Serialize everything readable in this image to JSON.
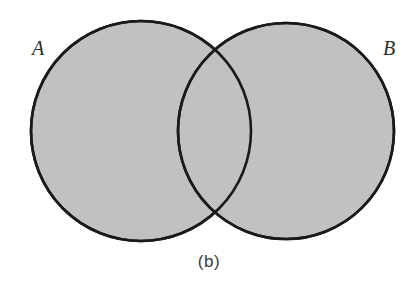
{
  "figure": {
    "caption": "(b)",
    "type": "venn-diagram",
    "background_color": "#ffffff",
    "stroke_color": "#1a1a1a",
    "fill_color": "#c3c3c3",
    "canvas": {
      "width": 418,
      "height": 283
    }
  },
  "sets": [
    {
      "id": "A",
      "label": "A",
      "fill": "#c3c3c3",
      "stroke": "#1a1a1a",
      "shape": "circle",
      "cx": 141,
      "cy": 131,
      "r": 110
    },
    {
      "id": "B",
      "label": "B",
      "fill": "#c3c3c3",
      "stroke": "#1a1a1a",
      "shape": "circle",
      "cx": 286,
      "cy": 131,
      "r": 108
    }
  ],
  "regions": {
    "a_only_shaded": true,
    "b_only_shaded": true,
    "intersection_shaded": true,
    "outside_shaded": false,
    "shaded_meaning": "A union B"
  },
  "chart_data": {
    "type": "venn",
    "title": "(b)",
    "sets": [
      "A",
      "B"
    ],
    "set_labels": [
      "A",
      "B"
    ],
    "shaded_regions": [
      "A only",
      "B only",
      "A and B"
    ],
    "unshaded_regions": [
      "outside A and B"
    ],
    "interpretation": "A ∪ B",
    "legend": "none",
    "grid": false
  }
}
